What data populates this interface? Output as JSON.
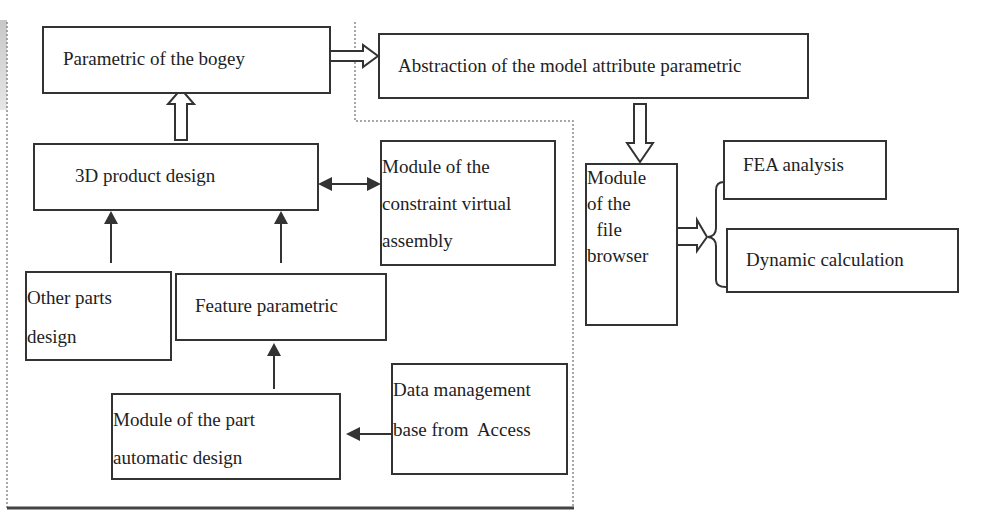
{
  "diagram": {
    "type": "flowchart",
    "nodes": {
      "bogey": {
        "label": "Parametric of the bogey"
      },
      "abstraction": {
        "label": "Abstraction of the model attribute parametric"
      },
      "product3d": {
        "label": "3D product design"
      },
      "constraint": {
        "lines": [
          "Module of the",
          "constraint virtual",
          "assembly"
        ]
      },
      "filebrowser": {
        "lines": [
          "Module",
          "of the",
          "  file",
          "browser"
        ]
      },
      "fea": {
        "label": "FEA analysis"
      },
      "dynamic": {
        "label": "Dynamic calculation"
      },
      "otherparts": {
        "lines": [
          "Other parts",
          "design"
        ]
      },
      "feature": {
        "label": "Feature parametric"
      },
      "datamgmt": {
        "lines": [
          "Data management",
          "base from  Access"
        ]
      },
      "partauto": {
        "lines": [
          "Module of the part",
          "automatic design"
        ]
      }
    },
    "edges": [
      {
        "from": "product3d",
        "to": "bogey",
        "style": "hollow-arrow"
      },
      {
        "from": "bogey",
        "to": "abstraction",
        "style": "hollow-arrow"
      },
      {
        "from": "abstraction",
        "to": "filebrowser",
        "style": "hollow-arrow"
      },
      {
        "from": "filebrowser",
        "to": [
          "fea",
          "dynamic"
        ],
        "style": "hollow-arrow-brace"
      },
      {
        "from": "product3d",
        "to": "constraint",
        "style": "double-headed"
      },
      {
        "from": "otherparts",
        "to": "product3d",
        "style": "solid-arrow"
      },
      {
        "from": "feature",
        "to": "product3d",
        "style": "solid-arrow"
      },
      {
        "from": "partauto",
        "to": "feature",
        "style": "solid-arrow"
      },
      {
        "from": "datamgmt",
        "to": "partauto",
        "style": "solid-arrow"
      }
    ],
    "colors": {
      "line": "#333333",
      "dotted_frame": "#888888",
      "background": "#ffffff"
    }
  }
}
